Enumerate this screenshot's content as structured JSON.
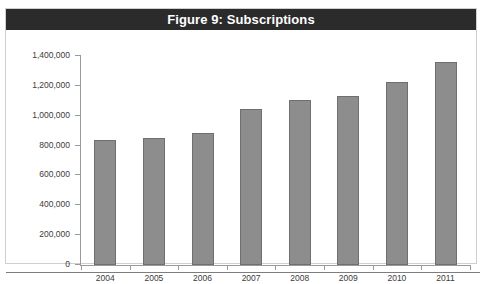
{
  "page": {
    "top_cropped_text": "in 2011:",
    "bottom_rule": "horizontal-rule"
  },
  "figure": {
    "title": "Figure 9: Subscriptions"
  },
  "chart_data": {
    "type": "bar",
    "title": "Figure 9: Subscriptions",
    "xlabel": "",
    "ylabel": "",
    "categories": [
      "2004",
      "2005",
      "2006",
      "2007",
      "2008",
      "2009",
      "2010",
      "2011"
    ],
    "values": [
      840000,
      850000,
      885000,
      1045000,
      1105000,
      1135000,
      1225000,
      1360000
    ],
    "ylim": [
      0,
      1400000
    ],
    "ytick_values": [
      0,
      200000,
      400000,
      600000,
      800000,
      1000000,
      1200000,
      1400000
    ],
    "ytick_labels": [
      "0",
      "200,000",
      "400,000",
      "600,000",
      "800,000",
      "1,000,000",
      "1,200,000",
      "1,400,000"
    ],
    "grid": false,
    "legend": null,
    "bar_color": "#8d8d8d",
    "bar_border_color": "#6f6f6f",
    "title_bar_color": "#2b2b2b",
    "title_text_color": "#ffffff",
    "axis_color": "#9a9a9a"
  }
}
